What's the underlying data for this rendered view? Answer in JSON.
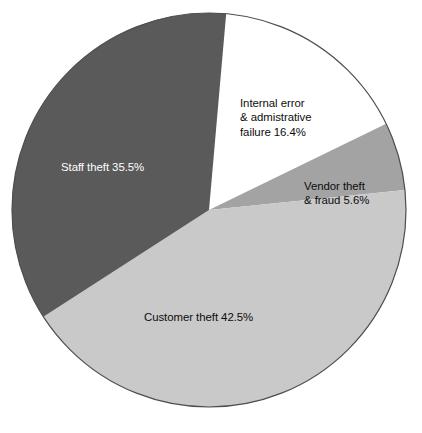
{
  "chart_data": {
    "type": "pie",
    "title": "",
    "subtitle": "",
    "xlabel": "",
    "ylabel": "",
    "legend_position": "none",
    "grid": false,
    "labels_inside_slices": true,
    "start_angle_deg": 5,
    "direction": "clockwise",
    "categories": [
      "Internal error & admistrative failure",
      "Vendor theft & fraud",
      "Customer theft",
      "Staff theft"
    ],
    "values": [
      16.4,
      5.6,
      42.5,
      35.5
    ],
    "units": "%",
    "total": 100.0,
    "slices": [
      {
        "name": "Internal error & admistrative failure",
        "value": 16.4,
        "label": "Internal error\n& admistrative\nfailure 16.4%",
        "color": "#ffffff",
        "text_color": "#0d0d0d",
        "start_angle_deg": 5,
        "end_angle_deg": 64.04
      },
      {
        "name": "Vendor theft & fraud",
        "value": 5.6,
        "label": "Vendor theft\n& fraud 5.6%",
        "color": "#a3a3a3",
        "text_color": "#0d0d0d",
        "start_angle_deg": 64.04,
        "end_angle_deg": 84.2
      },
      {
        "name": "Customer theft",
        "value": 42.5,
        "label": "Customer theft 42.5%",
        "color": "#c9c9c9",
        "text_color": "#0d0d0d",
        "start_angle_deg": 84.2,
        "end_angle_deg": 237.2
      },
      {
        "name": "Staff theft",
        "value": 35.5,
        "label": "Staff theft 35.5%",
        "color": "#5a5a5a",
        "text_color": "#ffffff",
        "start_angle_deg": 237.2,
        "end_angle_deg": 365
      }
    ],
    "geometry": {
      "center_x": 209,
      "center_y": 210,
      "radius": 197,
      "outline_color": "#4d4d4d",
      "outline_width": 1.2
    },
    "colors": {
      "background": "#ffffff",
      "internal_error": "#ffffff",
      "vendor_theft": "#a3a3a3",
      "customer_theft": "#c9c9c9",
      "staff_theft": "#5a5a5a",
      "outline": "#4d4d4d",
      "text_dark": "#0d0d0d",
      "text_light": "#ffffff"
    }
  },
  "labels": {
    "internal": "Internal error\n& admistrative\nfailure 16.4%",
    "vendor": "Vendor theft\n& fraud 5.6%",
    "customer": "Customer theft 42.5%",
    "staff": "Staff theft 35.5%"
  },
  "caption": {
    "text": ""
  }
}
